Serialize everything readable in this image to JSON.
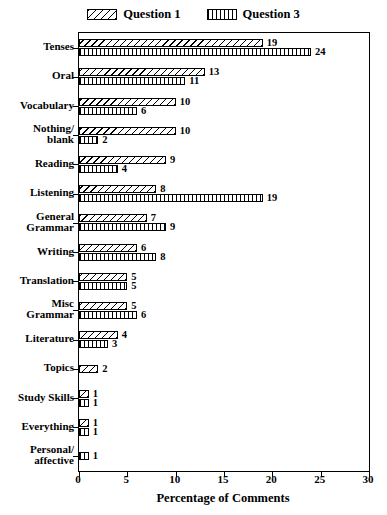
{
  "chart_data": {
    "type": "bar",
    "orientation": "horizontal",
    "title": "",
    "xlabel": "Percentage of Comments",
    "ylabel": "",
    "xlim": [
      0,
      30
    ],
    "xticks": [
      0,
      5,
      10,
      15,
      20,
      25,
      30
    ],
    "grid": false,
    "legend_position": "top-center",
    "categories": [
      "Tenses",
      "Oral",
      "Vocabulary",
      "Nothing/\nblank",
      "Reading",
      "Listening",
      "General\nGrammar",
      "Writing",
      "Translation",
      "Misc\nGrammar",
      "Literature",
      "Topics",
      "Study Skills",
      "Everything",
      "Personal/\naffective"
    ],
    "series": [
      {
        "name": "Question 1",
        "pattern": "diagonal-hatch",
        "values": [
          19,
          13,
          10,
          10,
          9,
          8,
          7,
          6,
          5,
          5,
          4,
          2,
          1,
          1,
          null
        ]
      },
      {
        "name": "Question 3",
        "pattern": "vertical-hatch",
        "values": [
          24,
          11,
          6,
          2,
          4,
          19,
          9,
          8,
          5,
          6,
          3,
          null,
          1,
          1,
          1
        ]
      }
    ]
  },
  "legend": {
    "entries": [
      {
        "label": "Question 1"
      },
      {
        "label": "Question 3"
      }
    ]
  },
  "colors": {
    "axis": "#000000",
    "bar_fill": "#ffffff",
    "bar_stroke": "#000000",
    "text": "#000000"
  }
}
